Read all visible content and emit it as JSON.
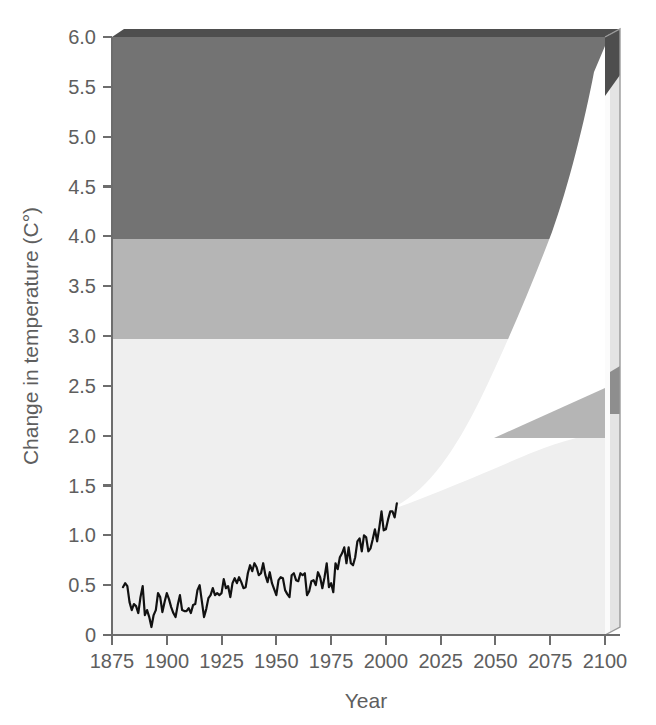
{
  "figure": {
    "title": "",
    "background_color": "#ffffff"
  },
  "axes": {
    "y_title": "Change in temperature (C°)",
    "x_title": "Year",
    "y_ticks": [
      "0",
      "0.5",
      "1.0",
      "1.5",
      "2.0",
      "2.5",
      "3.0",
      "3.5",
      "4.0",
      "4.5",
      "5.0",
      "5.5",
      "6.0"
    ],
    "x_ticks": [
      "1875",
      "1900",
      "1925",
      "1950",
      "1975",
      "2000",
      "2025",
      "2050",
      "2075",
      "2100"
    ]
  },
  "colors": {
    "band_high": "#737373",
    "band_mid": "#b5b5b5",
    "band_low": "#efefef",
    "band_top_edge": "#4e4e4e",
    "side_panel": "#e4e4e4",
    "side_panel_edge": "#9a9a9a",
    "projection_wedge": "#ffffff",
    "observed_line": "#111111",
    "axis": "#6d6d6d",
    "text": "#5e5e5e"
  },
  "chart_data": {
    "type": "line",
    "title": "",
    "xlabel": "Year",
    "ylabel": "Change in temperature (C°)",
    "xlim": [
      1875,
      2100
    ],
    "ylim": [
      0,
      6
    ],
    "grid": false,
    "legend": "none",
    "bands": [
      {
        "name": "low-risk band",
        "y_from": 0,
        "y_to": 2.0,
        "color": "#efefef"
      },
      {
        "name": "medium-risk band",
        "y_from": 2.0,
        "y_to": 3.0,
        "color": "#b5b5b5"
      },
      {
        "name": "high-risk band",
        "y_from": 3.0,
        "y_to": 6.0,
        "color": "#737373"
      }
    ],
    "projection_wedge": {
      "name": "projected warming range",
      "color": "#ffffff",
      "start_year": 2005,
      "end_year": 2100,
      "upper_at_2100": 5.6,
      "lower_at_2100": 2.0,
      "upper_bound": [
        [
          2005,
          1.3
        ],
        [
          2015,
          1.62
        ],
        [
          2025,
          2.0
        ],
        [
          2035,
          2.44
        ],
        [
          2045,
          2.94
        ],
        [
          2055,
          3.5
        ],
        [
          2065,
          4.02
        ],
        [
          2075,
          4.5
        ],
        [
          2085,
          4.95
        ],
        [
          2095,
          5.4
        ],
        [
          2100,
          5.6
        ]
      ],
      "lower_bound": [
        [
          2005,
          1.3
        ],
        [
          2015,
          1.34
        ],
        [
          2025,
          1.4
        ],
        [
          2035,
          1.47
        ],
        [
          2045,
          1.55
        ],
        [
          2055,
          1.63
        ],
        [
          2065,
          1.72
        ],
        [
          2075,
          1.81
        ],
        [
          2085,
          1.89
        ],
        [
          2095,
          1.97
        ],
        [
          2100,
          2.0
        ]
      ]
    },
    "series": [
      {
        "name": "Observed annual temperature",
        "color": "#111111",
        "x": [
          1880,
          1881,
          1882,
          1883,
          1884,
          1885,
          1886,
          1887,
          1888,
          1889,
          1890,
          1891,
          1892,
          1893,
          1894,
          1895,
          1896,
          1897,
          1898,
          1899,
          1900,
          1901,
          1902,
          1903,
          1904,
          1905,
          1906,
          1907,
          1908,
          1909,
          1910,
          1911,
          1912,
          1913,
          1914,
          1915,
          1916,
          1917,
          1918,
          1919,
          1920,
          1921,
          1922,
          1923,
          1924,
          1925,
          1926,
          1927,
          1928,
          1929,
          1930,
          1931,
          1932,
          1933,
          1934,
          1935,
          1936,
          1937,
          1938,
          1939,
          1940,
          1941,
          1942,
          1943,
          1944,
          1945,
          1946,
          1947,
          1948,
          1949,
          1950,
          1951,
          1952,
          1953,
          1954,
          1955,
          1956,
          1957,
          1958,
          1959,
          1960,
          1961,
          1962,
          1963,
          1964,
          1965,
          1966,
          1967,
          1968,
          1969,
          1970,
          1971,
          1972,
          1973,
          1974,
          1975,
          1976,
          1977,
          1978,
          1979,
          1980,
          1981,
          1982,
          1983,
          1984,
          1985,
          1986,
          1987,
          1988,
          1989,
          1990,
          1991,
          1992,
          1993,
          1994,
          1995,
          1996,
          1997,
          1998,
          1999,
          2000,
          2001,
          2002,
          2003,
          2004,
          2005
        ],
        "values": [
          0.48,
          0.52,
          0.49,
          0.33,
          0.25,
          0.31,
          0.29,
          0.22,
          0.38,
          0.49,
          0.2,
          0.25,
          0.18,
          0.08,
          0.2,
          0.25,
          0.42,
          0.38,
          0.23,
          0.33,
          0.42,
          0.36,
          0.28,
          0.22,
          0.18,
          0.3,
          0.4,
          0.25,
          0.24,
          0.24,
          0.27,
          0.22,
          0.3,
          0.31,
          0.45,
          0.5,
          0.34,
          0.18,
          0.26,
          0.37,
          0.4,
          0.47,
          0.4,
          0.42,
          0.4,
          0.42,
          0.56,
          0.47,
          0.49,
          0.38,
          0.52,
          0.57,
          0.52,
          0.58,
          0.53,
          0.47,
          0.48,
          0.62,
          0.7,
          0.64,
          0.72,
          0.68,
          0.6,
          0.62,
          0.72,
          0.6,
          0.53,
          0.63,
          0.52,
          0.46,
          0.4,
          0.55,
          0.58,
          0.57,
          0.45,
          0.41,
          0.38,
          0.6,
          0.62,
          0.55,
          0.54,
          0.62,
          0.6,
          0.62,
          0.4,
          0.44,
          0.54,
          0.55,
          0.5,
          0.63,
          0.58,
          0.47,
          0.58,
          0.72,
          0.48,
          0.52,
          0.43,
          0.72,
          0.66,
          0.78,
          0.82,
          0.88,
          0.72,
          0.88,
          0.72,
          0.7,
          0.78,
          0.94,
          0.97,
          0.84,
          1.0,
          0.98,
          0.84,
          0.87,
          0.96,
          1.06,
          0.94,
          1.08,
          1.24,
          1.05,
          1.06,
          1.16,
          1.24,
          1.24,
          1.18,
          1.32
        ]
      }
    ]
  }
}
